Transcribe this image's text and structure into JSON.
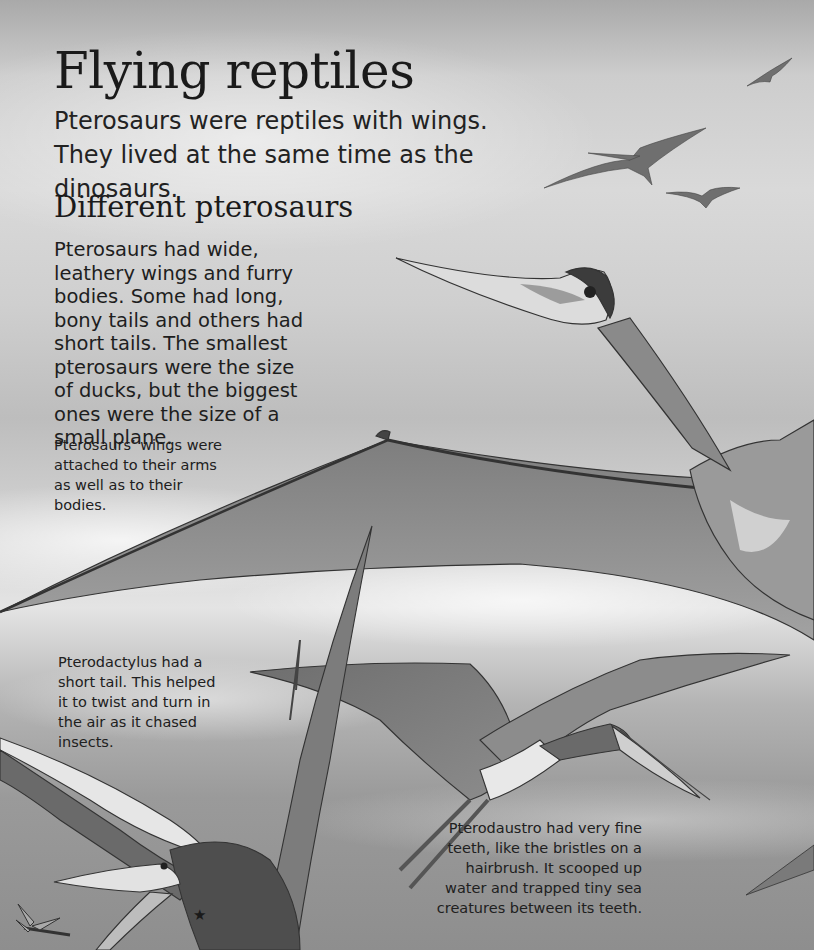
{
  "page": {
    "title": "Flying reptiles",
    "intro": "Pterosaurs were reptiles with wings. They lived at the same time as the dinosaurs.",
    "section": {
      "heading": "Different pterosaurs",
      "body": "Pterosaurs had wide, leathery wings and furry bodies. Some had long, bony tails and others had short tails. The smallest pterosaurs were the size of ducks, but the biggest ones were the size of a small plane."
    },
    "captions": {
      "wings": "Pterosaurs’ wings were attached to their arms as well as to their bodies.",
      "pterodactylus": "Pterodactylus had a short tail. This helped it to twist and turn in the air as it chased insects.",
      "pterodaustro": "Pterodaustro had very fine teeth, like the bristles on a hairbrush. It scooped up water and trapped tiny sea creatures between its teeth."
    },
    "marker": "★"
  },
  "illustrations": [
    {
      "name": "quetzalcoatlus",
      "description": "large long-necked pterosaur with huge wing across middle of page"
    },
    {
      "name": "pterodactylus",
      "description": "pterosaur with open beak chasing a dragonfly, bottom left"
    },
    {
      "name": "pterodaustro",
      "description": "pterosaur with curved bristle-toothed beak, lower center"
    },
    {
      "name": "distant-flock",
      "description": "three small pterosaurs flying in the upper right sky"
    },
    {
      "name": "dragonfly",
      "description": "small insect at bottom left"
    }
  ],
  "colors": {
    "sky_light": "#e4e4e4",
    "sky_mid": "#bdbdbd",
    "sky_dark": "#8e8e8e",
    "wing": "#8a8a8a",
    "wing_dark": "#5e5e5e",
    "ink": "#1c1c1c"
  }
}
